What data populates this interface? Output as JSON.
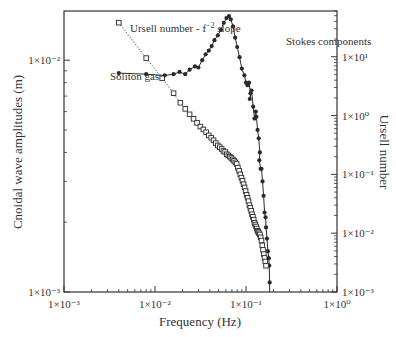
{
  "chart_data": {
    "type": "line",
    "title": "",
    "xlabel": "Frequency (Hz)",
    "ylabel": "Cnoidal wave amplitudes (m)",
    "y2label": "Ursell number",
    "xscale": "log",
    "yscale": "log",
    "y2scale": "log",
    "xlim": [
      0.001,
      1
    ],
    "ylim": [
      0.001,
      0.0163
    ],
    "y2lim": [
      0.001,
      60
    ],
    "grid": false,
    "x_ticks": [
      "1×10⁻³",
      "1×10⁻²",
      "1×10⁻¹",
      "1×10⁰"
    ],
    "y_ticks": [
      "1×10⁻³",
      "1×10⁻²"
    ],
    "y2_ticks": [
      "1×10⁻³",
      "1×10⁻²",
      "1×10⁻¹",
      "1×10⁰",
      "1×10¹"
    ],
    "annotations": [
      {
        "text": "Ursell number - f",
        "sup": "−2",
        "suffix": " slope",
        "x": 0.0045,
        "y2": 38
      },
      {
        "text": "Soliton gas",
        "x": 0.0045,
        "y": 0.0095
      },
      {
        "text": "Stokes components",
        "x": 0.2,
        "y": 0.0135
      }
    ],
    "series": [
      {
        "name": "Cnoidal wave amplitudes",
        "axis": "left",
        "marker": "filled-circle",
        "line": "solid",
        "color": "#2a2a2a",
        "x": [
          0.004,
          0.008,
          0.0128,
          0.016,
          0.0186,
          0.0215,
          0.024,
          0.0275,
          0.03,
          0.033,
          0.036,
          0.039,
          0.042,
          0.045,
          0.049,
          0.053,
          0.057,
          0.061,
          0.065,
          0.068,
          0.072,
          0.076,
          0.08,
          0.085,
          0.09,
          0.096,
          0.1,
          0.104,
          0.108,
          0.112,
          0.11,
          0.115,
          0.12,
          0.124,
          0.128,
          0.13,
          0.134,
          0.138,
          0.142,
          0.14,
          0.145,
          0.148,
          0.152,
          0.156,
          0.16,
          0.164,
          0.166,
          0.17,
          0.174,
          0.178,
          0.18,
          0.182
        ],
        "y": [
          0.0088,
          0.0087,
          0.0086,
          0.0087,
          0.0089,
          0.0087,
          0.0091,
          0.0094,
          0.0093,
          0.01,
          0.0106,
          0.011,
          0.0115,
          0.0122,
          0.0128,
          0.0135,
          0.0145,
          0.0152,
          0.0155,
          0.015,
          0.014,
          0.0125,
          0.0114,
          0.0103,
          0.0092,
          0.0086,
          0.008,
          0.0078,
          0.008,
          0.0072,
          0.0068,
          0.0074,
          0.0063,
          0.0056,
          0.006,
          0.0057,
          0.005,
          0.0046,
          0.004,
          0.0037,
          0.0034,
          0.0034,
          0.003,
          0.0026,
          0.0022,
          0.0021,
          0.0019,
          0.0017,
          0.0015,
          0.0014,
          0.0013,
          0.0011
        ]
      },
      {
        "name": "Ursell number",
        "axis": "right",
        "marker": "open-square",
        "line": "dotted",
        "color": "#2a2a2a",
        "x": [
          0.004,
          0.008,
          0.012,
          0.016,
          0.019,
          0.0215,
          0.024,
          0.0265,
          0.029,
          0.0315,
          0.034,
          0.0365,
          0.039,
          0.0415,
          0.044,
          0.0465,
          0.049,
          0.0515,
          0.054,
          0.0565,
          0.059,
          0.0615,
          0.064,
          0.0665,
          0.069,
          0.0715,
          0.074,
          0.0765,
          0.079,
          0.0815,
          0.084,
          0.0865,
          0.089,
          0.0915,
          0.094,
          0.0965,
          0.099,
          0.1015,
          0.104,
          0.1065,
          0.109,
          0.1115,
          0.114,
          0.1165,
          0.119,
          0.1215,
          0.124,
          0.1265,
          0.129,
          0.1315,
          0.134,
          0.1365,
          0.139,
          0.142,
          0.145,
          0.148,
          0.151,
          0.154,
          0.157,
          0.16,
          0.163,
          0.166
        ],
        "y": [
          38.0,
          9.5,
          4.3,
          2.4,
          1.65,
          1.3,
          1.05,
          0.88,
          0.75,
          0.65,
          0.58,
          0.52,
          0.46,
          0.42,
          0.38,
          0.34,
          0.31,
          0.29,
          0.27,
          0.25,
          0.24,
          0.22,
          0.21,
          0.2,
          0.19,
          0.18,
          0.17,
          0.16,
          0.15,
          0.13,
          0.115,
          0.1,
          0.088,
          0.078,
          0.068,
          0.06,
          0.052,
          0.045,
          0.04,
          0.035,
          0.03,
          0.027,
          0.024,
          0.021,
          0.019,
          0.017,
          0.015,
          0.014,
          0.013,
          0.012,
          0.011,
          0.0105,
          0.01,
          0.0095,
          0.0085,
          0.0075,
          0.0062,
          0.0052,
          0.0044,
          0.0038,
          0.0033,
          0.0028
        ]
      }
    ]
  }
}
